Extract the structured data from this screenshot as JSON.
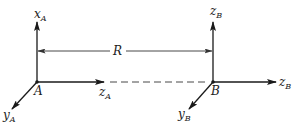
{
  "diagram": {
    "colors": {
      "line": "#1a1a1a",
      "text": "#222222",
      "background": "#ffffff"
    },
    "frame_a": {
      "origin_label": "A",
      "vertical_axis": {
        "main": "x",
        "sub": "A"
      },
      "horizontal_axis": {
        "main": "z",
        "sub": "A"
      },
      "diagonal_axis": {
        "main": "y",
        "sub": "A"
      }
    },
    "frame_b": {
      "origin_label": "B",
      "vertical_axis": {
        "main": "z",
        "sub": "B"
      },
      "horizontal_axis": {
        "main": "z",
        "sub": "B"
      },
      "diagonal_axis": {
        "main": "y",
        "sub": "B"
      }
    },
    "distance": {
      "label": "R"
    }
  }
}
